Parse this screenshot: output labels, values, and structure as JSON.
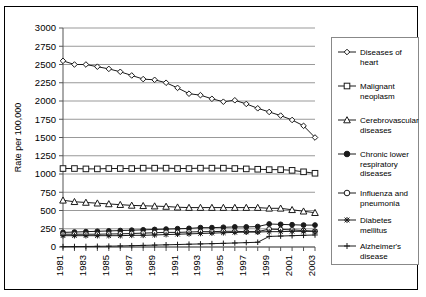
{
  "chart_data": {
    "type": "line",
    "title": "",
    "xlabel": "",
    "ylabel": "Rate per 100,000",
    "ylim": [
      0,
      3000
    ],
    "ytick_step": 250,
    "yticks": [
      0,
      250,
      500,
      750,
      1000,
      1250,
      1500,
      1750,
      2000,
      2250,
      2500,
      2750,
      3000
    ],
    "grid": true,
    "legend_position": "right",
    "x": [
      1981,
      1982,
      1983,
      1984,
      1985,
      1986,
      1987,
      1988,
      1989,
      1990,
      1991,
      1992,
      1993,
      1994,
      1995,
      1996,
      1997,
      1998,
      1999,
      2000,
      2001,
      2002,
      2003
    ],
    "xtick_labels": [
      "1981",
      "1983",
      "1985",
      "1987",
      "1989",
      "1991",
      "1993",
      "1995",
      "1997",
      "1999",
      "2001",
      "2003"
    ],
    "xtick_values": [
      1981,
      1983,
      1985,
      1987,
      1989,
      1991,
      1993,
      1995,
      1997,
      1999,
      2001,
      2003
    ],
    "series": [
      {
        "name": "Diseases of heart",
        "marker": "diamond-open",
        "values": [
          2550,
          2500,
          2500,
          2470,
          2440,
          2400,
          2350,
          2300,
          2290,
          2250,
          2180,
          2100,
          2080,
          2030,
          1990,
          2010,
          1960,
          1900,
          1850,
          1800,
          1740,
          1660,
          1500
        ]
      },
      {
        "name": "Malignant neoplasm",
        "marker": "square-open",
        "values": [
          1075,
          1075,
          1070,
          1070,
          1075,
          1075,
          1075,
          1080,
          1080,
          1080,
          1075,
          1075,
          1080,
          1080,
          1080,
          1075,
          1070,
          1065,
          1060,
          1060,
          1050,
          1030,
          1010
        ]
      },
      {
        "name": "Cerebrovascular diseases",
        "marker": "triangle-open",
        "values": [
          640,
          620,
          610,
          600,
          590,
          580,
          570,
          565,
          560,
          555,
          545,
          540,
          540,
          540,
          540,
          540,
          540,
          540,
          530,
          530,
          510,
          490,
          470
        ]
      },
      {
        "name": "Chronic lower respiratory diseases",
        "marker": "circle-solid",
        "values": [
          200,
          205,
          210,
          215,
          220,
          225,
          230,
          235,
          240,
          245,
          250,
          255,
          265,
          265,
          270,
          275,
          275,
          280,
          315,
          310,
          305,
          300,
          300
        ]
      },
      {
        "name": "Influenza and pneumonia",
        "marker": "circle-open",
        "values": [
          175,
          175,
          175,
          175,
          178,
          180,
          185,
          190,
          195,
          200,
          200,
          205,
          210,
          210,
          215,
          215,
          210,
          210,
          245,
          240,
          235,
          225,
          215
        ]
      },
      {
        "name": "Diabetes mellitus",
        "marker": "star-solid",
        "values": [
          155,
          155,
          155,
          155,
          155,
          155,
          160,
          160,
          165,
          170,
          175,
          180,
          185,
          190,
          195,
          200,
          205,
          205,
          210,
          210,
          215,
          215,
          215
        ]
      },
      {
        "name": "Alzheimer's disease",
        "marker": "plus",
        "values": [
          5,
          6,
          7,
          9,
          11,
          14,
          18,
          22,
          26,
          30,
          34,
          38,
          42,
          46,
          50,
          55,
          60,
          65,
          145,
          150,
          155,
          160,
          165
        ]
      }
    ]
  },
  "legend": {
    "entries": [
      {
        "label_line1": "Diseases of",
        "label_line2": "heart",
        "marker": "diamond-open"
      },
      {
        "label_line1": "Malignant",
        "label_line2": "neoplasm",
        "marker": "square-open"
      },
      {
        "label_line1": "Cerebrovascular",
        "label_line2": "diseases",
        "marker": "triangle-open"
      },
      {
        "label_line1": "Chronic lower",
        "label_line2": "respiratory",
        "label_line3": "diseases",
        "marker": "circle-solid"
      },
      {
        "label_line1": "Influenza and",
        "label_line2": "pneumonia",
        "marker": "circle-open"
      },
      {
        "label_line1": "Diabetes",
        "label_line2": "mellitus",
        "marker": "star-solid"
      },
      {
        "label_line1": "Alzheimer's",
        "label_line2": "disease",
        "marker": "plus"
      }
    ]
  },
  "colors": {
    "line": "#1a1a1a",
    "grid": "#999999",
    "axis": "#555555",
    "frame": "#000000",
    "background": "#ffffff"
  }
}
